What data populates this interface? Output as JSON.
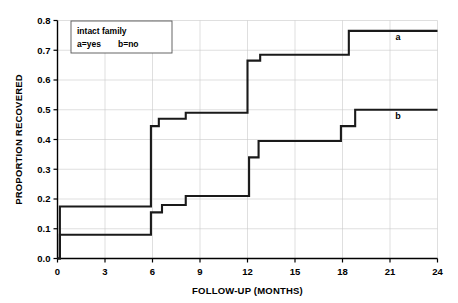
{
  "chart_data": {
    "type": "line",
    "title": "",
    "xlabel": "FOLLOW-UP (MONTHS)",
    "ylabel": "PROPORTION RECOVERED",
    "xlim": [
      0,
      24
    ],
    "ylim": [
      0.0,
      0.8
    ],
    "xticks": [
      "0",
      "3",
      "6",
      "9",
      "12",
      "15",
      "18",
      "21",
      "24"
    ],
    "xtick_values": [
      0,
      3,
      6,
      9,
      12,
      15,
      18,
      21,
      24
    ],
    "yticks": [
      "0.0",
      "0.1",
      "0.2",
      "0.3",
      "0.4",
      "0.5",
      "0.6",
      "0.7",
      "0.8"
    ],
    "ytick_values": [
      0.0,
      0.1,
      0.2,
      0.3,
      0.4,
      0.5,
      0.6,
      0.7,
      0.8
    ],
    "grid": true,
    "legend_position": "upper-left-inside",
    "annotations": [
      {
        "text": "a",
        "x": 21.5,
        "y": 0.735
      },
      {
        "text": "b",
        "x": 21.5,
        "y": 0.468
      }
    ],
    "legend_box": {
      "line1": "intact family",
      "line2_left": "a=yes",
      "line2_right": "b=no"
    },
    "series": [
      {
        "name": "a",
        "label": "intact family = yes",
        "step": "post",
        "points": [
          [
            0.0,
            0.0
          ],
          [
            0.15,
            0.175
          ],
          [
            5.4,
            0.175
          ],
          [
            5.9,
            0.445
          ],
          [
            6.3,
            0.445
          ],
          [
            6.4,
            0.47
          ],
          [
            7.9,
            0.47
          ],
          [
            8.1,
            0.49
          ],
          [
            11.5,
            0.49
          ],
          [
            12.0,
            0.665
          ],
          [
            12.6,
            0.665
          ],
          [
            12.8,
            0.685
          ],
          [
            17.8,
            0.685
          ],
          [
            18.4,
            0.765
          ],
          [
            24.0,
            0.765
          ]
        ]
      },
      {
        "name": "b",
        "label": "intact family = no",
        "step": "post",
        "points": [
          [
            0.0,
            0.0
          ],
          [
            0.15,
            0.08
          ],
          [
            5.4,
            0.08
          ],
          [
            5.9,
            0.155
          ],
          [
            6.4,
            0.155
          ],
          [
            6.6,
            0.18
          ],
          [
            7.9,
            0.18
          ],
          [
            8.1,
            0.21
          ],
          [
            11.7,
            0.21
          ],
          [
            12.1,
            0.34
          ],
          [
            12.4,
            0.34
          ],
          [
            12.7,
            0.395
          ],
          [
            17.5,
            0.395
          ],
          [
            17.9,
            0.445
          ],
          [
            18.3,
            0.445
          ],
          [
            18.8,
            0.5
          ],
          [
            24.0,
            0.5
          ]
        ]
      }
    ]
  }
}
